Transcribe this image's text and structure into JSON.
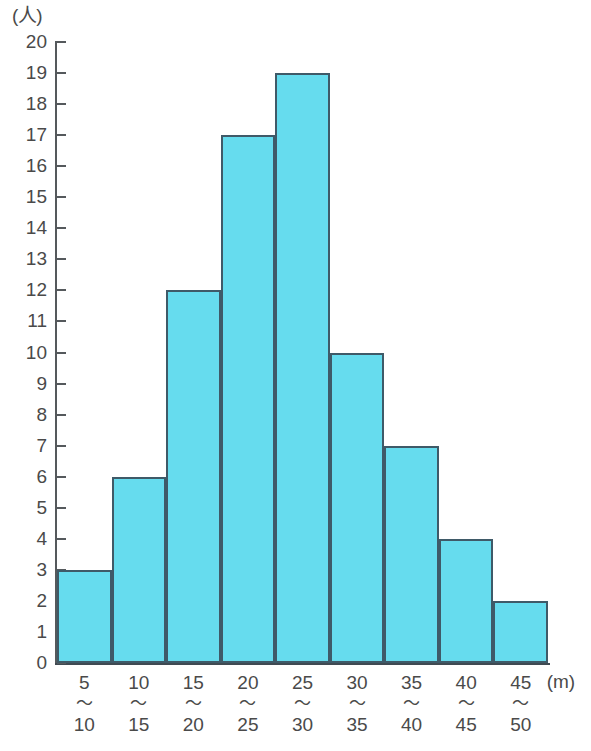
{
  "chart_data": {
    "type": "bar",
    "title": "",
    "subtitle": "",
    "xlabel": "(m)",
    "ylabel": "(人)",
    "categories": [
      "5〜10",
      "10〜15",
      "15〜20",
      "20〜25",
      "25〜30",
      "30〜35",
      "35〜40",
      "40〜45",
      "45〜50"
    ],
    "bin_lower": [
      5,
      10,
      15,
      20,
      25,
      30,
      35,
      40,
      45
    ],
    "bin_upper": [
      10,
      15,
      20,
      25,
      30,
      35,
      40,
      45,
      50
    ],
    "separator": "〜",
    "values": [
      3,
      6,
      12,
      17,
      19,
      10,
      7,
      4,
      2
    ],
    "ylim": [
      0,
      20
    ],
    "ytick_step": 1,
    "yticks": [
      0,
      1,
      2,
      3,
      4,
      5,
      6,
      7,
      8,
      9,
      10,
      11,
      12,
      13,
      14,
      15,
      16,
      17,
      18,
      19,
      20
    ],
    "ytick_labels": [
      "0",
      "1",
      "2",
      "3",
      "4",
      "5",
      "6",
      "7",
      "8",
      "9",
      "10",
      "11",
      "12",
      "13",
      "14",
      "15",
      "16",
      "17",
      "18",
      "19",
      "20"
    ],
    "grid": false,
    "legend": null,
    "bar_fill_color": "#66dcee",
    "bar_border_color": "#3f5a68",
    "axis_color": "#55595c",
    "background_color": "#ffffff",
    "total_count": 80
  }
}
